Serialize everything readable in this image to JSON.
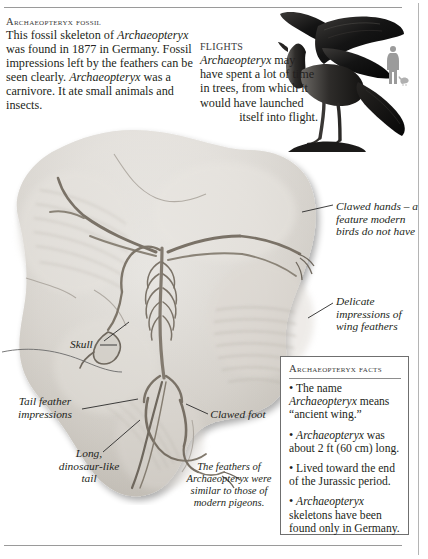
{
  "page": {
    "background": "#ffffff",
    "text_color": "#231f20"
  },
  "intro": {
    "title": "Archaeopteryx fossil",
    "body_html": "This fossil skeleton of <i>Archaeopteryx</i> was found in 1877 in Germany. Fossil impressions left by the feathers can be seen clearly. <i>Archaeopteryx</i> was a carnivore. It ate small animals and insects."
  },
  "flights": {
    "title": "FLIGHTS",
    "body_html": "<i>Archaeopteryx</i> may have spent a lot of time in trees, from which it would have launched <span class=\"last\">itself into flight.</span>"
  },
  "annotations": {
    "clawed_hands": "Clawed hands – a feature modern birds do not have",
    "delicate_impressions": "Delicate impressions of wing feathers",
    "skull": "Skull",
    "tail_feather_impressions": "Tail feather impressions",
    "long_dinosaur_like_tail": "Long, dinosaur-like tail",
    "clawed_foot": "Clawed foot"
  },
  "caption": {
    "feathers_html": "The feathers of <i>Archaeopteryx</i> were similar to those of modern pigeons."
  },
  "facts": {
    "title": "Archaeopteryx facts",
    "items": [
      "The name <i>Archaeopteryx</i> means “ancient wing.”",
      "<i>Archaeopteryx</i> was about 2 ft (60 cm) long.",
      "Lived toward the end of the Jurassic period.",
      "<i>Archaeopteryx</i> skeletons have been found only in Germany."
    ],
    "bullet": "•",
    "border_color": "#6f6f6f"
  },
  "artwork": {
    "fossil_slab_label": "archaeopteryx-fossil-slab",
    "bird_label": "archaeopteryx-bird-illustration",
    "scale_label": "human-scale-silhouette",
    "slab_color_light": "#e8e6e2",
    "slab_color_mid": "#cfcbc5",
    "slab_color_dark": "#a9a49d",
    "bird_color": "#1a1a1a",
    "scale_color": "#9b9b9b"
  }
}
